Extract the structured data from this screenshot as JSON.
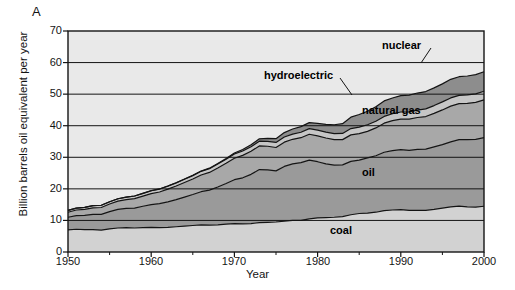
{
  "panel": {
    "label": "A"
  },
  "axes": {
    "xlabel": "Year",
    "ylabel": "Billion barrels oil equivalent per year",
    "xticks": [
      "1950",
      "1960",
      "1970",
      "1980",
      "1990",
      "2000"
    ],
    "yticks": [
      "0",
      "10",
      "20",
      "30",
      "40",
      "50",
      "60",
      "70"
    ]
  },
  "colors": {
    "background": "#e9e9e9",
    "coal": "#d2d2d2",
    "oil": "#9a9a9a",
    "natural_gas": "#a8a8a8",
    "hydroelectric": "#c6c6c6",
    "nuclear": "#8d8d8d",
    "line": "#141414",
    "grid": "#141414",
    "text": "#141414"
  },
  "series_labels": {
    "coal": "coal",
    "oil": "oil",
    "natural_gas": "natural gas",
    "hydroelectric": "hydroelectric",
    "nuclear": "nuclear"
  },
  "chart_data": {
    "type": "area",
    "stacked": true,
    "title": "",
    "xlabel": "Year",
    "ylabel": "Billion barrels oil equivalent per year",
    "xlim": [
      1950,
      2000
    ],
    "ylim": [
      0,
      70
    ],
    "grid": "horizontal",
    "legend": "inline-annotations",
    "x": [
      1950,
      1951,
      1952,
      1953,
      1954,
      1955,
      1956,
      1957,
      1958,
      1959,
      1960,
      1961,
      1962,
      1963,
      1964,
      1965,
      1966,
      1967,
      1968,
      1969,
      1970,
      1971,
      1972,
      1973,
      1974,
      1975,
      1976,
      1977,
      1978,
      1979,
      1980,
      1981,
      1982,
      1983,
      1984,
      1985,
      1986,
      1987,
      1988,
      1989,
      1990,
      1991,
      1992,
      1993,
      1994,
      1995,
      1996,
      1997,
      1998,
      1999,
      2000
    ],
    "series": [
      {
        "name": "coal",
        "values": [
          7.0,
          7.2,
          7.1,
          7.1,
          6.9,
          7.3,
          7.6,
          7.7,
          7.6,
          7.7,
          7.8,
          7.7,
          7.8,
          8.0,
          8.2,
          8.4,
          8.6,
          8.5,
          8.6,
          8.8,
          9.0,
          8.9,
          9.0,
          9.3,
          9.4,
          9.5,
          9.8,
          10.0,
          10.0,
          10.5,
          10.8,
          10.9,
          11.0,
          11.2,
          11.8,
          12.2,
          12.3,
          12.6,
          13.1,
          13.3,
          13.4,
          13.2,
          13.2,
          13.2,
          13.5,
          13.9,
          14.3,
          14.5,
          14.3,
          14.2,
          14.5
        ]
      },
      {
        "name": "oil",
        "values": [
          4.0,
          4.3,
          4.5,
          4.8,
          5.0,
          5.5,
          5.9,
          6.1,
          6.3,
          6.8,
          7.2,
          7.6,
          8.1,
          8.6,
          9.2,
          9.8,
          10.5,
          11.1,
          12.0,
          12.9,
          13.9,
          14.6,
          15.6,
          16.8,
          16.6,
          16.2,
          17.3,
          17.9,
          18.3,
          18.6,
          17.8,
          17.0,
          16.5,
          16.4,
          16.9,
          16.9,
          17.5,
          17.9,
          18.5,
          18.8,
          19.0,
          19.0,
          19.3,
          19.4,
          19.8,
          20.1,
          20.6,
          21.1,
          21.3,
          21.5,
          21.7
        ]
      },
      {
        "name": "natural gas",
        "values": [
          1.6,
          1.8,
          1.9,
          2.1,
          2.2,
          2.4,
          2.6,
          2.8,
          3.0,
          3.2,
          3.5,
          3.7,
          4.0,
          4.3,
          4.6,
          4.9,
          5.3,
          5.6,
          6.0,
          6.4,
          6.8,
          7.1,
          7.3,
          7.5,
          7.5,
          7.4,
          7.7,
          7.8,
          7.9,
          8.2,
          8.2,
          8.2,
          8.1,
          8.0,
          8.4,
          8.4,
          8.4,
          8.8,
          9.2,
          9.5,
          9.7,
          9.9,
          10.1,
          10.3,
          10.6,
          11.0,
          11.3,
          11.4,
          11.5,
          11.7,
          12.0
        ]
      },
      {
        "name": "hydroelectric",
        "values": [
          0.6,
          0.62,
          0.65,
          0.67,
          0.7,
          0.73,
          0.76,
          0.79,
          0.83,
          0.86,
          0.9,
          0.94,
          0.98,
          1.0,
          1.05,
          1.1,
          1.15,
          1.2,
          1.25,
          1.3,
          1.35,
          1.4,
          1.45,
          1.5,
          1.55,
          1.6,
          1.62,
          1.65,
          1.72,
          1.78,
          1.82,
          1.85,
          1.9,
          1.95,
          2.0,
          2.05,
          2.1,
          2.12,
          2.15,
          2.18,
          2.25,
          2.3,
          2.35,
          2.42,
          2.48,
          2.55,
          2.6,
          2.62,
          2.65,
          2.68,
          2.7
        ]
      },
      {
        "name": "nuclear",
        "values": [
          0.0,
          0.0,
          0.0,
          0.0,
          0.0,
          0.0,
          0.0,
          0.0,
          0.0,
          0.0,
          0.02,
          0.03,
          0.04,
          0.05,
          0.07,
          0.09,
          0.12,
          0.15,
          0.2,
          0.25,
          0.32,
          0.45,
          0.6,
          0.75,
          0.95,
          1.2,
          1.4,
          1.6,
          1.8,
          1.9,
          2.1,
          2.5,
          2.8,
          3.1,
          3.6,
          4.0,
          4.3,
          4.6,
          4.9,
          5.0,
          5.2,
          5.3,
          5.4,
          5.5,
          5.6,
          5.7,
          5.9,
          5.9,
          6.0,
          6.1,
          6.2
        ]
      }
    ],
    "totals_note": {
      "1950": 13.2,
      "1960": 13.4,
      "1970": 31.4,
      "1980": 40.7,
      "1990": 49.6,
      "2000": 57.1
    }
  }
}
